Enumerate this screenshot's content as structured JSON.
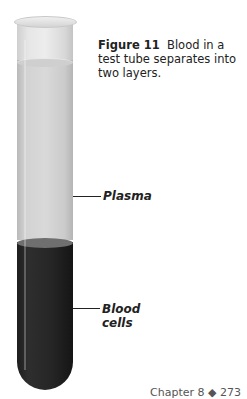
{
  "figure": {
    "number_label": "Figure 11",
    "caption": "Blood in a test tube separates into two layers."
  },
  "labels": {
    "plasma": "Plasma",
    "blood_cells_line1": "Blood",
    "blood_cells_line2": "cells"
  },
  "footer": {
    "text": "Chapter 8 ◆ 273"
  },
  "colors": {
    "plasma": "#d2d2d2",
    "blood_cells": "#262626",
    "text": "#222222"
  }
}
